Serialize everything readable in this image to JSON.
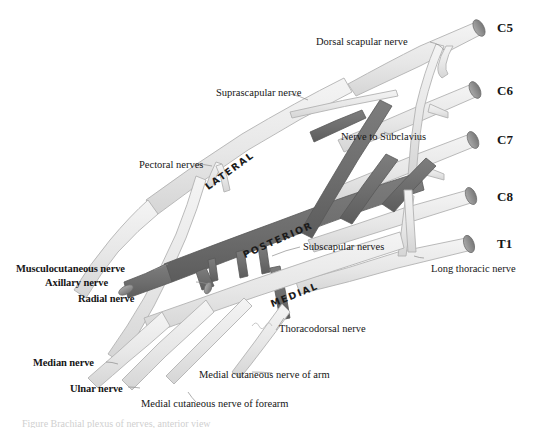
{
  "figure": {
    "background_color": "#ffffff",
    "nerve_light_color": "#e9e9e9",
    "nerve_light_stroke": "#b6b6b6",
    "cord_dark_color": "#6e6e6e",
    "cord_dark_stroke": "#555555",
    "cut_face_color": "#8e8e8e",
    "label_color": "#161616"
  },
  "roots": [
    {
      "label": "C5"
    },
    {
      "label": "C6"
    },
    {
      "label": "C7"
    },
    {
      "label": "C8"
    },
    {
      "label": "T1"
    }
  ],
  "cords": [
    {
      "label": "LATERAL"
    },
    {
      "label": "POSTERIOR"
    },
    {
      "label": "MEDIAL"
    }
  ],
  "branch_labels": [
    {
      "label": "Dorsal scapular nerve"
    },
    {
      "label": "Suprascapular nerve"
    },
    {
      "label": "Nerve to Subclavius"
    },
    {
      "label": "Pectoral nerves"
    },
    {
      "label": "Subscapular nerves"
    },
    {
      "label": "Thoracodorsal nerve"
    },
    {
      "label": "Long thoracic nerve"
    },
    {
      "label": "Medial cutaneous nerve of arm"
    },
    {
      "label": "Medial cutaneous nerve of forearm"
    }
  ],
  "terminal_labels": [
    {
      "label": "Musculocutaneous nerve"
    },
    {
      "label": "Axillary nerve"
    },
    {
      "label": "Radial nerve"
    },
    {
      "label": "Median nerve"
    },
    {
      "label": "Ulnar nerve"
    }
  ],
  "caption": {
    "text": "Figure    Brachial plexus of nerves, anterior view"
  }
}
